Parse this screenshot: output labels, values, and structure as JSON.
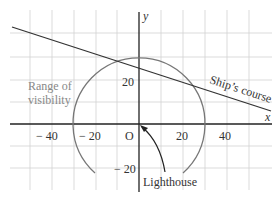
{
  "diagram": {
    "type": "coordinate-diagram",
    "axes": {
      "x_label": "x",
      "y_label": "y",
      "origin_label": "O",
      "x_ticks": [
        {
          "value": -40,
          "label": "− 40"
        },
        {
          "value": -20,
          "label": "− 20"
        },
        {
          "value": 20,
          "label": "20"
        },
        {
          "value": 40,
          "label": "40"
        }
      ],
      "y_ticks": [
        {
          "value": 20,
          "label": "20"
        },
        {
          "value": -20,
          "label": "− 20"
        }
      ]
    },
    "labels": {
      "range_line1": "Range of",
      "range_line2": "visibility",
      "ship_course": "Ship’s course",
      "lighthouse": "Lighthouse"
    },
    "circle": {
      "center": [
        0,
        0
      ],
      "radius": 30
    },
    "colors": {
      "grid": "#cfcfcf",
      "axis": "#222222",
      "circle": "#777777",
      "line": "#333333",
      "range_text": "#888888"
    }
  }
}
